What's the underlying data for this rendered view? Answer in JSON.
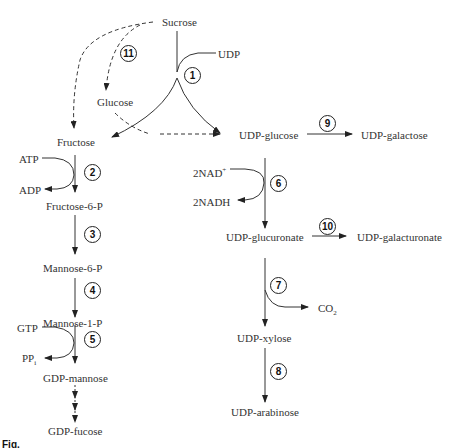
{
  "diagram": {
    "nodes": {
      "sucrose": "Sucrose",
      "udp": "UDP",
      "glucose": "Glucose",
      "fructose": "Fructose",
      "udp_glucose": "UDP-glucose",
      "udp_galactose": "UDP-galactose",
      "atp": "ATP",
      "adp": "ADP",
      "fructose_6p": "Fructose-6-P",
      "nad": "2NAD",
      "nad_sup": "+",
      "nadh": "2NADH",
      "udp_glucuronate": "UDP-glucuronate",
      "udp_galacturonate": "UDP-galacturonate",
      "mannose_6p": "Mannose-6-P",
      "mannose_1p": "Mannose-1-P",
      "co2": "CO",
      "co2_sub": "2",
      "gtp": "GTP",
      "ppi": "PP",
      "ppi_sub": "i",
      "udp_xylose": "UDP-xylose",
      "gdp_mannose": "GDP-mannose",
      "udp_arabinose": "UDP-arabinose",
      "gdp_fucose": "GDP-fucose"
    },
    "steps": [
      "1",
      "2",
      "3",
      "4",
      "5",
      "6",
      "7",
      "8",
      "9",
      "10",
      "11"
    ],
    "caption": "Fig."
  }
}
